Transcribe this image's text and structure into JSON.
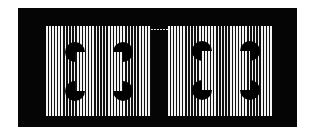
{
  "figure": {
    "colors": {
      "frame": "#050505",
      "stripe_dark": "#111111",
      "stripe_light": "#f4f4f4",
      "inducer": "#000000"
    },
    "panels": [
      {
        "id": "left",
        "inducers": [
          {
            "cx": 75,
            "cy": 52,
            "notch": "bottom-right"
          },
          {
            "cx": 123,
            "cy": 52,
            "notch": "bottom-left"
          },
          {
            "cx": 75,
            "cy": 91,
            "notch": "top-right"
          },
          {
            "cx": 123,
            "cy": 91,
            "notch": "top-left"
          }
        ]
      },
      {
        "id": "right",
        "inducers": [
          {
            "cx": 202,
            "cy": 51,
            "notch": "bottom-right"
          },
          {
            "cx": 250,
            "cy": 51,
            "notch": "bottom-left"
          },
          {
            "cx": 202,
            "cy": 90,
            "notch": "top-right"
          },
          {
            "cx": 250,
            "cy": 90,
            "notch": "top-left"
          }
        ]
      }
    ]
  }
}
